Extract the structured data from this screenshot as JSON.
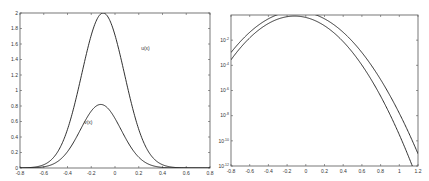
{
  "chart_data": [
    {
      "type": "line",
      "title": "",
      "xlabel": "",
      "ylabel": "",
      "xlim": [
        -0.8,
        0.8
      ],
      "ylim": [
        0,
        2
      ],
      "yscale": "linear",
      "grid": false,
      "xticks": [
        -0.8,
        -0.6,
        -0.4,
        -0.2,
        0,
        0.2,
        0.4,
        0.6,
        0.8
      ],
      "xtick_labels": [
        "-0.8",
        "-0.6",
        "-0.4",
        "-0.2",
        "0",
        "0.2",
        "0.4",
        "0.6",
        "0.8"
      ],
      "yticks": [
        0,
        0.2,
        0.4,
        0.6,
        0.8,
        1,
        1.2,
        1.4,
        1.6,
        1.8,
        2
      ],
      "ytick_labels": [
        "0",
        "0.2",
        "0.4",
        "0.6",
        "0.8",
        "1",
        "1.2",
        "1.4",
        "1.6",
        "1.8",
        "2"
      ],
      "series": [
        {
          "name": "u(x)",
          "peak_x": -0.1,
          "peak_y": 2.0,
          "width": 0.18,
          "x": [
            -0.8,
            -0.6,
            -0.4,
            -0.3,
            -0.2,
            -0.1,
            0,
            0.1,
            0.2,
            0.4,
            0.6,
            0.8
          ],
          "values": [
            0.0,
            0.06,
            0.5,
            1.0,
            1.6,
            2.0,
            1.75,
            1.2,
            0.65,
            0.1,
            0.01,
            0.0
          ]
        },
        {
          "name": "v(x)",
          "peak_x": -0.12,
          "peak_y": 0.82,
          "width": 0.17,
          "x": [
            -0.8,
            -0.6,
            -0.4,
            -0.3,
            -0.2,
            -0.12,
            0,
            0.1,
            0.2,
            0.4,
            0.6,
            0.8
          ],
          "values": [
            0.0,
            0.03,
            0.25,
            0.5,
            0.74,
            0.82,
            0.7,
            0.45,
            0.22,
            0.03,
            0.0,
            0.0
          ]
        }
      ],
      "annotations": [
        {
          "text": "u(x)",
          "x": 0.22,
          "y": 1.52
        },
        {
          "text": "v(x)",
          "x": -0.26,
          "y": 0.57
        }
      ]
    },
    {
      "type": "line",
      "title": "",
      "xlabel": "",
      "ylabel": "",
      "xlim": [
        -0.8,
        1.2
      ],
      "ylim": [
        1e-12,
        1
      ],
      "yscale": "log",
      "grid": false,
      "xticks": [
        -0.8,
        -0.6,
        -0.4,
        -0.2,
        0,
        0.2,
        0.4,
        0.6,
        0.8,
        1,
        1.2
      ],
      "xtick_labels": [
        "-0.8",
        "-0.6",
        "-0.4",
        "-0.2",
        "0",
        "0.2",
        "0.4",
        "0.6",
        "0.8",
        "1",
        "1.2"
      ],
      "yticks": [
        1e-12,
        1e-10,
        1e-08,
        1e-06,
        0.0001,
        0.01
      ],
      "ytick_labels": [
        "10^-12",
        "10^-10",
        "10^-8",
        "10^-6",
        "10^-4",
        "10^-2"
      ],
      "series": [
        {
          "name": "u(x)",
          "peak_x": -0.1,
          "peak_y": 2.0,
          "width": 0.18
        },
        {
          "name": "v(x)",
          "peak_x": -0.12,
          "peak_y": 0.82,
          "width": 0.17
        }
      ]
    }
  ],
  "figure": {
    "panels": [
      {
        "frame": {
          "left": 20,
          "top": 13,
          "right": 210,
          "bottom": 168
        }
      },
      {
        "frame": {
          "left": 231,
          "top": 15,
          "right": 418,
          "bottom": 166
        }
      }
    ],
    "line_color": "#1a1a1a",
    "frame_color": "#555555"
  }
}
